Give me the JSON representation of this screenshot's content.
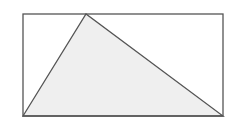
{
  "diagram": {
    "width": 233,
    "height": 121,
    "background": "#ffffff",
    "stroke_color": "#555555",
    "triangle_fill": "#efefef",
    "rectangle": {
      "x": 23,
      "y": 14,
      "width": 200,
      "height": 102
    },
    "triangle": {
      "points": "23,116 86,14 223,116"
    }
  }
}
